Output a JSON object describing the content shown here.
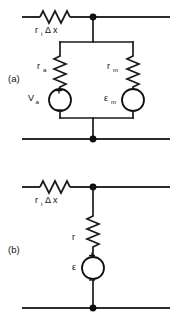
{
  "figure": {
    "background_color": "#ffffff",
    "line_color": "#1a1a1a"
  },
  "panels": [
    {
      "id": "a",
      "label": "(a)",
      "axial_resistor": {
        "name": "axial-resistor",
        "symbol": "r",
        "subscript": "i",
        "factor": "Δ x",
        "label_full": "rᵢ Δx"
      },
      "branches": [
        {
          "side": "left",
          "resistor": {
            "symbol": "r",
            "subscript": "a",
            "label_full": "rₐ"
          },
          "source": {
            "symbol": "V",
            "subscript": "a",
            "label_full": "Vₐ",
            "plus_sign": "+",
            "minus_sign": "−",
            "polarity_shown": true
          }
        },
        {
          "side": "right",
          "resistor": {
            "symbol": "r",
            "subscript": "m",
            "label_full": "rₘ"
          },
          "source": {
            "symbol": "ε",
            "subscript": "m",
            "label_full": "εₘ",
            "plus_sign": "",
            "minus_sign": "",
            "polarity_shown": false
          }
        }
      ]
    },
    {
      "id": "b",
      "label": "(b)",
      "axial_resistor": {
        "name": "axial-resistor",
        "symbol": "r",
        "subscript": "i",
        "factor": "Δ x",
        "label_full": "rᵢ Δx"
      },
      "branches": [
        {
          "side": "center",
          "resistor": {
            "symbol": "r",
            "subscript": "",
            "label_full": "r"
          },
          "source": {
            "symbol": "ε",
            "subscript": "",
            "label_full": "ε",
            "plus_sign": "+",
            "minus_sign": "−",
            "polarity_shown": true
          }
        }
      ]
    }
  ]
}
